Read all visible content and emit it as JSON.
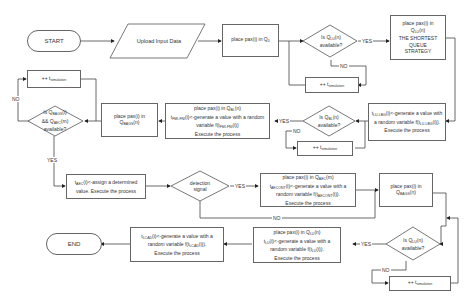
{
  "nodes": {
    "start": "START",
    "upload": "Upload Input Data",
    "place_q0": "place pax(i) in Q0",
    "is_qlu": "Is QLU(n) available?",
    "shortest": "place pax(i) in QLU(n) THE SHORTEST QUEUE STRATEGY",
    "inc_sim_1": "++ tsimulation",
    "gen_value_1": "tLU-LBG(i)<-generate a value with a random variable f(tLU-LBG(i)). Execute the process",
    "is_qbl": "Is QBL(n) available?",
    "inc_sim_2": "++ tsimulation",
    "place_bl": "place pax(i) in QBL(n) tFMI-FNI(i)<-generate a value with a random variable f(tFMI-FNI(i)) Execute the process",
    "place_bagg": "place pax(i) in QBAGS(n)",
    "is_bagg": "Is QBAGS(i) && QAEC(m) available?",
    "inc_sim_3": "++ tsimulation",
    "assign": "tAEC(i)<-assign a determined value. Execute the process",
    "detection": "detection signal",
    "place_aec": "place pax(i) in QAEC(m) tAECONT(i)<-generate a value with a random variable f(tAECONT(i)). Execute the process",
    "place_bag2": "place pax(i) in QBAGS(n)",
    "is_qlu2": "Is QLU(n) available?",
    "inc_sim_4": "++ tsimulation",
    "place_lu": "place pax(i) in QLU(n) tLU(i)<-generate a value with a random variable f(tLU(i)). Execute the process",
    "gen_lcad": "tLCAD(i)<-generate a value with a random variable f(tLCAD(i)). Execute the process",
    "end": "END"
  },
  "edge_labels": {
    "yes": "YES",
    "no": "NO"
  }
}
